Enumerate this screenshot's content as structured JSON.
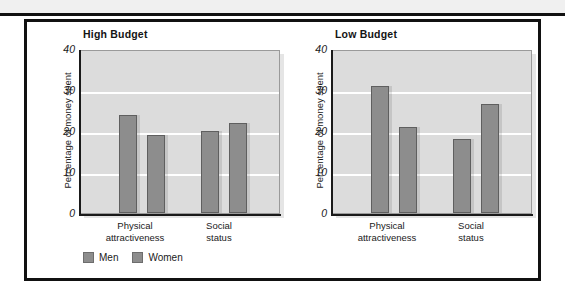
{
  "figure": {
    "background_color": "#ffffff",
    "frame_color": "#111111",
    "top_strip_color": "#f0f0f0"
  },
  "legend": {
    "items": [
      {
        "label": "Men",
        "color": "#8d8d8d"
      },
      {
        "label": "Women",
        "color": "#8d8d8d"
      }
    ]
  },
  "chart_data": [
    {
      "type": "bar",
      "title": "High Budget",
      "xlabel": "",
      "ylabel": "Percentage of money spent",
      "categories": [
        "Physical attractiveness",
        "Social status"
      ],
      "category_lines": [
        [
          "Physical",
          "attractiveness"
        ],
        [
          "Social",
          "status"
        ]
      ],
      "series": [
        {
          "name": "Men",
          "values": [
            24,
            20
          ],
          "color": "#8d8d8d"
        },
        {
          "name": "Women",
          "values": [
            19,
            22
          ],
          "color": "#8d8d8d"
        }
      ],
      "ylim": [
        0,
        40
      ],
      "yticks": [
        40,
        30,
        20,
        10,
        0
      ],
      "grid": true,
      "legend_position": "bottom-left"
    },
    {
      "type": "bar",
      "title": "Low Budget",
      "xlabel": "",
      "ylabel": "Percentage of money spent",
      "categories": [
        "Physical attractiveness",
        "Social status"
      ],
      "category_lines": [
        [
          "Physical",
          "attractiveness"
        ],
        [
          "Social",
          "status"
        ]
      ],
      "series": [
        {
          "name": "Men",
          "values": [
            31,
            18
          ],
          "color": "#8d8d8d"
        },
        {
          "name": "Women",
          "values": [
            21,
            26.5
          ],
          "color": "#8d8d8d"
        }
      ],
      "ylim": [
        0,
        40
      ],
      "yticks": [
        40,
        30,
        20,
        10,
        0
      ],
      "grid": true,
      "legend_position": "none"
    }
  ]
}
